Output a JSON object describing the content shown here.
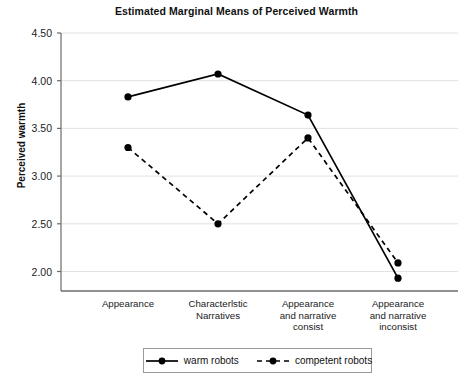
{
  "chart_data": {
    "type": "line",
    "title": "Estimated Marginal Means of Perceived Warmth",
    "xlabel": "",
    "ylabel": "Perceived warmth",
    "categories": [
      "Appearance",
      "Characterlstic Narratives",
      "Appearance and narrative consist",
      "Appearance and narrative inconsist"
    ],
    "category_lines": [
      [
        "Appearance"
      ],
      [
        "Characterlstic",
        "Narratives"
      ],
      [
        "Appearance",
        "and narrative",
        "consist"
      ],
      [
        "Appearance",
        "and narrative",
        "inconsist"
      ]
    ],
    "series": [
      {
        "name": "warm robots",
        "style": "solid",
        "values": [
          3.83,
          4.07,
          3.64,
          1.93
        ]
      },
      {
        "name": "competent robots",
        "style": "dashed",
        "values": [
          3.3,
          2.5,
          3.4,
          2.09
        ]
      }
    ],
    "ylim": [
      1.78,
      4.6
    ],
    "yticks": [
      "4.50",
      "4.00",
      "3.50",
      "3.00",
      "2.50",
      "2.00"
    ],
    "ytick_values": [
      4.5,
      4.0,
      3.5,
      3.0,
      2.5,
      2.0
    ],
    "grid": true,
    "legend_position": "bottom",
    "colors": {
      "line": "#000000",
      "marker": "#000000",
      "grid": "#e2e2e2",
      "axis": "#6b6b6b",
      "text": "#1a1a1a"
    }
  }
}
